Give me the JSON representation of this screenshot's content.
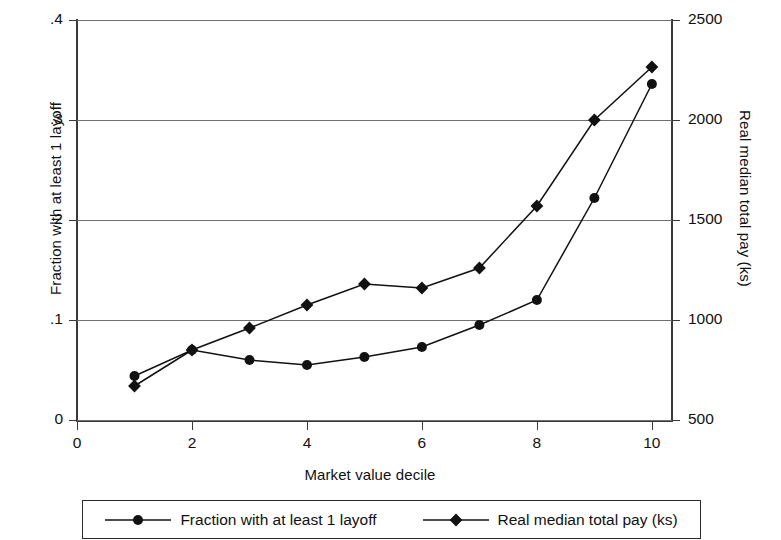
{
  "chart_data": {
    "type": "line",
    "title": "",
    "xlabel": "Market value decile",
    "ylabel": "Fraction with at least 1 layoff",
    "ylabel_right": "Real median total pay (ks)",
    "x": [
      1,
      2,
      3,
      4,
      5,
      6,
      7,
      8,
      9,
      10
    ],
    "xlim": [
      0,
      10.35
    ],
    "ylim": [
      0,
      0.4
    ],
    "ylim_right": [
      500,
      2500
    ],
    "xticks": [
      0,
      2,
      4,
      6,
      8,
      10
    ],
    "xticklabels": [
      "0",
      "2",
      "4",
      "6",
      "8",
      "10"
    ],
    "yticks": [
      0,
      0.1,
      0.2,
      0.3,
      0.4
    ],
    "yticklabels": [
      "0",
      ".1",
      ".2",
      ".3",
      ".4"
    ],
    "yticks_right": [
      500,
      1000,
      1500,
      2000,
      2500
    ],
    "yticklabels_right": [
      "500",
      "1000",
      "1500",
      "2000",
      "2500"
    ],
    "grid": true,
    "grid_axis": "y",
    "legend_position": "below",
    "line_color": "#111111",
    "series": [
      {
        "name": "Fraction with at least 1 layoff",
        "marker": "circle",
        "axis": "left",
        "values": [
          0.044,
          0.07,
          0.06,
          0.055,
          0.063,
          0.073,
          0.095,
          0.12,
          0.222,
          0.336
        ]
      },
      {
        "name": "Real median total pay (ks)",
        "marker": "diamond",
        "axis": "right",
        "values": [
          670,
          1250,
          960,
          1075,
          1180,
          1160,
          1260,
          1570,
          2000,
          2265
        ],
        "values_left_scale": [
          0.034,
          0.07,
          0.092,
          0.115,
          0.136,
          0.132,
          0.152,
          0.214,
          0.3,
          0.353
        ]
      }
    ]
  },
  "legend": {
    "entries": [
      {
        "label": "Fraction with at least 1 layoff",
        "marker": "circle"
      },
      {
        "label": "Real median total pay (ks)",
        "marker": "diamond"
      }
    ]
  }
}
